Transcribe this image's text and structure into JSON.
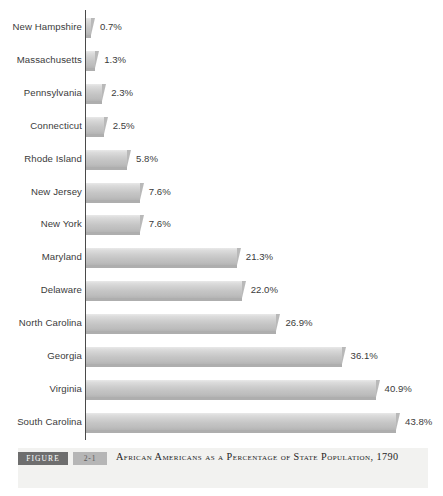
{
  "chart_data": {
    "type": "bar",
    "orientation": "horizontal",
    "title": "African Americans as a Percentage of State Population, 1790",
    "xlabel": "",
    "ylabel": "",
    "xlim": [
      0,
      43.8
    ],
    "grid": false,
    "legend": null,
    "categories": [
      "New Hampshire",
      "Massachusetts",
      "Pennsylvania",
      "Connecticut",
      "Rhode Island",
      "New Jersey",
      "New York",
      "Maryland",
      "Delaware",
      "North Carolina",
      "Georgia",
      "Virginia",
      "South Carolina"
    ],
    "values": [
      0.7,
      1.3,
      2.3,
      2.5,
      5.8,
      7.6,
      7.6,
      21.3,
      22.0,
      26.9,
      36.1,
      40.9,
      43.8
    ],
    "value_labels": [
      "0.7%",
      "1.3%",
      "2.3%",
      "2.5%",
      "5.8%",
      "7.6%",
      "7.6%",
      "21.3%",
      "22.0%",
      "26.9%",
      "36.1%",
      "40.9%",
      "43.8%"
    ],
    "bar_color": "#c8c8c8",
    "axis_color": "#4a4a4a",
    "text_color": "#3b3b3b"
  },
  "caption": {
    "figure_label": "FIGURE",
    "figure_number": "2-1",
    "title_line1": "African Americans as a Percentage of State Population,",
    "title_line2": "1790",
    "tag_background": "#6e6e6e",
    "number_background": "#b6b6b6",
    "band_background": "#f2f2f0"
  }
}
